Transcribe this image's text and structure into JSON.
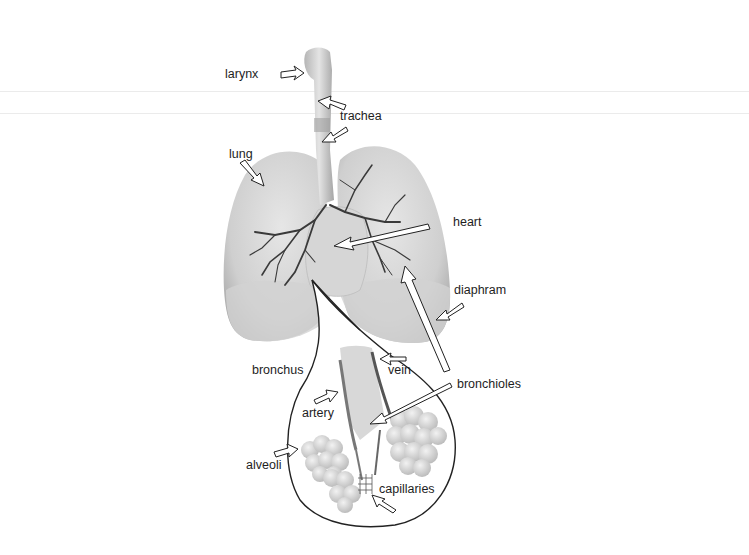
{
  "diagram": {
    "labels": {
      "larynx": "larynx",
      "trachea": "trachea",
      "lung": "lung",
      "heart": "heart",
      "diaphram": "diaphram",
      "bronchus": "bronchus",
      "vein": "vein",
      "bronchioles": "bronchioles",
      "artery": "artery",
      "alveoli": "alveoli",
      "capillaries": "capillaries"
    },
    "colors": {
      "background": "#ffffff",
      "lung_fill": "#c9c9c9",
      "lung_light": "#e2e2e2",
      "airway": "#3a3a3a",
      "outline": "#222222",
      "arrow_fill": "#ffffff"
    }
  }
}
